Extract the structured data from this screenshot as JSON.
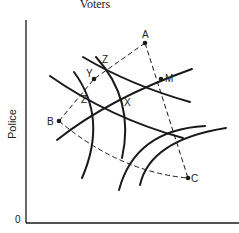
{
  "title": "Voters",
  "axes": {
    "y_label": "Police",
    "origin_label": "0",
    "x_label": ""
  },
  "points": {
    "A": {
      "label": "A"
    },
    "M": {
      "label": "M"
    },
    "C": {
      "label": "C"
    },
    "B": {
      "label": "B"
    },
    "Y": {
      "label": "Y"
    }
  },
  "intersections": {
    "Z_upper": {
      "label": "Z"
    },
    "Z_lower": {
      "label": "Z"
    },
    "X": {
      "label": "X"
    }
  },
  "colors": {
    "ink": "#1a1a1a",
    "background": "#ffffff"
  }
}
